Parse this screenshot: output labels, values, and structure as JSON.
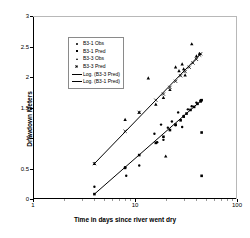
{
  "chart_data": {
    "type": "scatter",
    "title": "",
    "xlabel": "Time in days since river went dry",
    "ylabel": "Drawdown Meters",
    "xscale": "log",
    "yscale": "linear",
    "xlim": [
      1,
      100
    ],
    "ylim": [
      0,
      3
    ],
    "grid": false,
    "legend_position": "upper-left-inside",
    "xticks": [
      "1",
      "10",
      "100"
    ],
    "xtick_values": [
      1,
      10,
      100
    ],
    "yticks": [
      "0",
      "0.5",
      "1",
      "1.5",
      "2",
      "2.5",
      "3"
    ],
    "ytick_values": [
      0,
      0.5,
      1,
      1.5,
      2,
      2.5,
      3
    ],
    "legend": [
      "B3-1 Obs",
      "B3-1 Pred",
      "B3-3 Obs",
      "B3-3 Pred",
      "Log. (B3-3 Pred)",
      "Log. (B3-1 Pred)"
    ],
    "series": [
      {
        "name": "B3-1 Obs",
        "marker": "dot",
        "points": [
          [
            4.0,
            0.2
          ],
          [
            8.0,
            0.52
          ],
          [
            8.2,
            0.38
          ],
          [
            11.0,
            0.55
          ],
          [
            15.5,
            1.07
          ],
          [
            16.5,
            0.93
          ],
          [
            18.0,
            1.22
          ],
          [
            19.0,
            0.97
          ],
          [
            21.0,
            1.17
          ],
          [
            23.0,
            1.27
          ],
          [
            25.0,
            1.21
          ],
          [
            26.5,
            1.42
          ],
          [
            29.0,
            1.18
          ],
          [
            30.0,
            1.36
          ],
          [
            33.0,
            1.47
          ],
          [
            36.0,
            1.52
          ],
          [
            40.0,
            1.58
          ],
          [
            44.0,
            1.62
          ]
        ]
      },
      {
        "name": "B3-1 Pred",
        "marker": "square",
        "points": [
          [
            4.0,
            0.08
          ],
          [
            8.0,
            0.51
          ],
          [
            11.0,
            0.72
          ],
          [
            16.0,
            0.92
          ],
          [
            19.0,
            1.02
          ],
          [
            22.0,
            1.13
          ],
          [
            25.0,
            1.22
          ],
          [
            28.0,
            1.29
          ],
          [
            30.0,
            1.35
          ],
          [
            32.0,
            1.4
          ],
          [
            35.0,
            1.46
          ],
          [
            38.0,
            1.51
          ],
          [
            41.0,
            1.56
          ],
          [
            44.0,
            1.6
          ],
          [
            45.0,
            1.62
          ],
          [
            45.0,
            1.09
          ],
          [
            45.0,
            0.38
          ]
        ]
      },
      {
        "name": "B3-3 Obs",
        "marker": "triangle",
        "points": [
          [
            4.0,
            0.58
          ],
          [
            8.0,
            1.3
          ],
          [
            11.0,
            1.42
          ],
          [
            13.5,
            1.98
          ],
          [
            16.0,
            1.55
          ],
          [
            19.0,
            1.66
          ],
          [
            22.0,
            1.79
          ],
          [
            25.0,
            2.16
          ],
          [
            27.0,
            2.1
          ],
          [
            29.0,
            2.21
          ],
          [
            30.0,
            2.13
          ],
          [
            31.0,
            2.03
          ],
          [
            36.0,
            2.54
          ],
          [
            40.0,
            2.34
          ],
          [
            43.0,
            2.38
          ],
          [
            20.0,
            0.7
          ]
        ]
      },
      {
        "name": "B3-3 Pred",
        "marker": "x",
        "points": [
          [
            4.0,
            0.58
          ],
          [
            8.0,
            1.11
          ],
          [
            11.0,
            1.42
          ],
          [
            16.0,
            1.62
          ],
          [
            19.0,
            1.72
          ],
          [
            22.0,
            1.83
          ],
          [
            25.0,
            1.93
          ],
          [
            28.0,
            2.02
          ],
          [
            31.0,
            2.09
          ],
          [
            34.0,
            2.16
          ],
          [
            37.0,
            2.23
          ],
          [
            40.0,
            2.29
          ],
          [
            43.0,
            2.36
          ],
          [
            44.0,
            2.38
          ]
        ]
      }
    ],
    "trendlines": [
      {
        "name": "Log. (B3-3 Pred)",
        "style": "solid",
        "color": "#000000",
        "from": [
          4.0,
          0.58
        ],
        "to": [
          44.0,
          2.38
        ]
      },
      {
        "name": "Log. (B3-1 Pred)",
        "style": "solid",
        "color": "#000000",
        "from": [
          4.0,
          0.08
        ],
        "to": [
          45.0,
          1.62
        ]
      }
    ]
  }
}
